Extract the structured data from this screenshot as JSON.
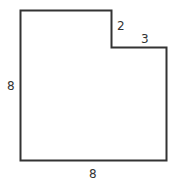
{
  "figure": {
    "shape": "L-shaped polygon (square with top-right corner removed)",
    "labels": {
      "left_side": "8",
      "bottom_side": "8",
      "notch_vertical": "2",
      "notch_horizontal": "3"
    },
    "stroke_color": "#333333"
  }
}
